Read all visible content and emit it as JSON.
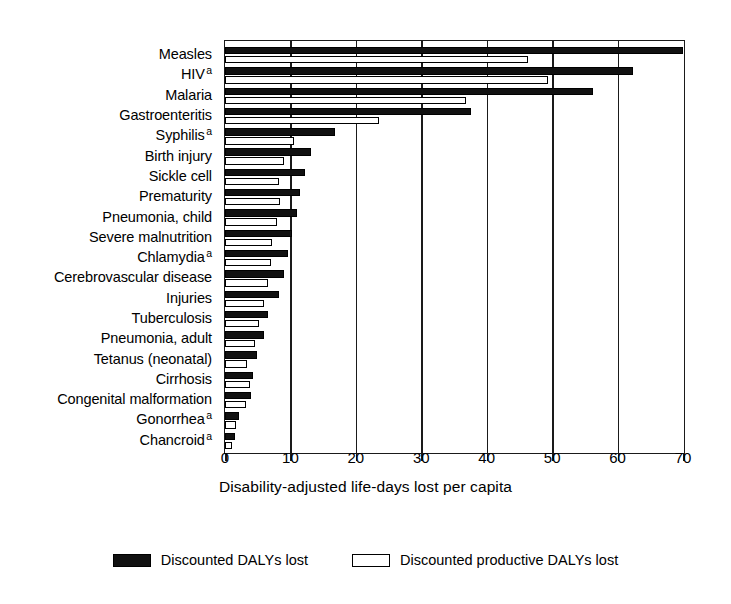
{
  "chart_data": {
    "type": "bar",
    "orientation": "horizontal",
    "title": "",
    "xlabel": "Disability-adjusted life-days lost per capita",
    "ylabel": "",
    "xlim": [
      0,
      70
    ],
    "xticks": [
      0,
      10,
      20,
      30,
      40,
      50,
      60,
      70
    ],
    "grid": true,
    "grid_axis": "x",
    "legend_position": "bottom",
    "categories": [
      "Measles",
      "HIV",
      "Malaria",
      "Gastroenteritis",
      "Syphilis",
      "Birth injury",
      "Sickle cell",
      "Prematurity",
      "Pneumonia, child",
      "Severe malnutrition",
      "Chlamydia",
      "Cerebrovascular disease",
      "Injuries",
      "Tuberculosis",
      "Pneumonia, adult",
      "Tetanus (neonatal)",
      "Cirrhosis",
      "Congenital malformation",
      "Gonorrhea",
      "Chancroid"
    ],
    "category_footnotes": [
      "",
      "a",
      "",
      "",
      "a",
      "",
      "",
      "",
      "",
      "",
      "a",
      "",
      "",
      "",
      "",
      "",
      "",
      "",
      "a",
      "a"
    ],
    "series": [
      {
        "name": "Discounted DALYs lost",
        "color": "#111111",
        "values": [
          70.0,
          62.3,
          56.3,
          37.6,
          16.8,
          13.1,
          12.3,
          11.5,
          11.0,
          10.2,
          9.6,
          9.0,
          8.2,
          6.6,
          6.0,
          4.9,
          4.3,
          4.0,
          2.2,
          1.5
        ]
      },
      {
        "name": "Discounted productive DALYs lost",
        "color": "#ffffff",
        "values": [
          46.3,
          49.4,
          36.8,
          23.5,
          10.5,
          9.0,
          8.2,
          8.4,
          8.0,
          7.2,
          7.0,
          6.6,
          6.0,
          5.2,
          4.6,
          3.4,
          3.8,
          3.2,
          1.7,
          1.0
        ]
      }
    ]
  },
  "axis": {
    "xlabel": "Disability-adjusted life-days lost per capita",
    "tick_labels": [
      "0",
      "10",
      "20",
      "30",
      "40",
      "50",
      "60",
      "70"
    ]
  },
  "legend": {
    "items": [
      {
        "label": "Discounted DALYs lost",
        "swatch": "filled-black"
      },
      {
        "label": "Discounted productive DALYs lost",
        "swatch": "outlined-white"
      }
    ]
  }
}
